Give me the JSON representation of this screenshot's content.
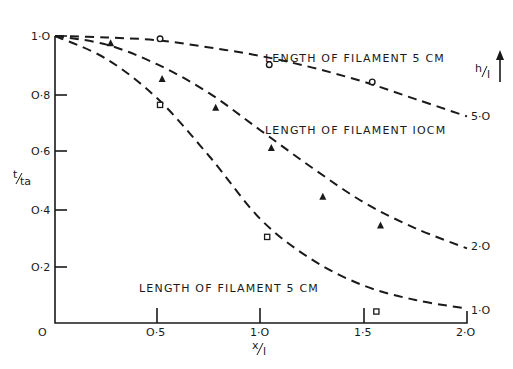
{
  "chart_data": {
    "type": "line",
    "title": "",
    "xlabel": "x/l",
    "ylabel": "t/ta",
    "xlim": [
      0,
      2.0
    ],
    "ylim": [
      0,
      1.0
    ],
    "grid": false,
    "x_ticks": [
      {
        "value": 0,
        "label": "O"
      },
      {
        "value": 0.5,
        "label": "O·5"
      },
      {
        "value": 1.0,
        "label": "1·O"
      },
      {
        "value": 1.5,
        "label": "1·5"
      },
      {
        "value": 2.0,
        "label": "2·O"
      }
    ],
    "y_ticks": [
      {
        "value": 0.2,
        "label": "O·2"
      },
      {
        "value": 0.4,
        "label": "O·4"
      },
      {
        "value": 0.6,
        "label": "O·6"
      },
      {
        "value": 0.8,
        "label": "O·8"
      },
      {
        "value": 1.0,
        "label": "1·O"
      }
    ],
    "right_axis_label": "h/l",
    "series": [
      {
        "name": "h/l = 5.0",
        "end_label": "5·O",
        "style": "dashed",
        "curve": [
          [
            0,
            1.0
          ],
          [
            0.25,
            0.995
          ],
          [
            0.5,
            0.985
          ],
          [
            0.75,
            0.96
          ],
          [
            1.0,
            0.93
          ],
          [
            1.25,
            0.89
          ],
          [
            1.5,
            0.84
          ],
          [
            1.75,
            0.78
          ],
          [
            2.0,
            0.72
          ]
        ],
        "marker": "circle",
        "points": [
          [
            0.51,
            0.99
          ],
          [
            1.04,
            0.9
          ],
          [
            1.54,
            0.84
          ]
        ]
      },
      {
        "name": "h/l = 2.0",
        "end_label": "2·O",
        "style": "dashed",
        "curve": [
          [
            0,
            1.0
          ],
          [
            0.25,
            0.97
          ],
          [
            0.5,
            0.9
          ],
          [
            0.75,
            0.8
          ],
          [
            1.0,
            0.67
          ],
          [
            1.25,
            0.54
          ],
          [
            1.5,
            0.42
          ],
          [
            1.75,
            0.33
          ],
          [
            2.0,
            0.26
          ]
        ],
        "marker": "triangle",
        "points": [
          [
            0.27,
            0.975
          ],
          [
            0.52,
            0.85
          ],
          [
            0.78,
            0.75
          ],
          [
            1.05,
            0.61
          ],
          [
            1.3,
            0.44
          ],
          [
            1.58,
            0.34
          ]
        ]
      },
      {
        "name": "h/l = 1.0",
        "end_label": "1·O",
        "style": "dashed",
        "curve": [
          [
            0,
            1.0
          ],
          [
            0.25,
            0.92
          ],
          [
            0.5,
            0.78
          ],
          [
            0.75,
            0.58
          ],
          [
            1.0,
            0.36
          ],
          [
            1.25,
            0.22
          ],
          [
            1.5,
            0.13
          ],
          [
            1.75,
            0.08
          ],
          [
            2.0,
            0.05
          ]
        ],
        "marker": "square",
        "points": [
          [
            0.51,
            0.76
          ],
          [
            1.03,
            0.3
          ],
          [
            1.56,
            0.04
          ]
        ]
      }
    ],
    "annotations": [
      {
        "text": "LENGTH OF FILAMENT  5 CM",
        "x": 0.98,
        "y": 0.925
      },
      {
        "text": "LENGTH OF FILAMENT  IOCM",
        "x": 0.98,
        "y": 0.68
      },
      {
        "text": "LENGTH OF FILAMENT  5 CM",
        "x": 0.42,
        "y": 0.13
      }
    ]
  },
  "labels": {
    "ylabel_main": "t",
    "ylabel_sub": "ta",
    "xlabel_main": "x",
    "xlabel_sub": "l",
    "right_label_main": "h",
    "right_label_sub": "l",
    "annot_top": "LENGTH OF FILAMENT  5 CM",
    "annot_mid": "LENGTH OF FILAMENT  IOCM",
    "annot_bottom": "LENGTH OF FILAMENT  5 CM",
    "end_5": "5·O",
    "end_2": "2·O",
    "end_1": "1·O",
    "origin": "O"
  }
}
